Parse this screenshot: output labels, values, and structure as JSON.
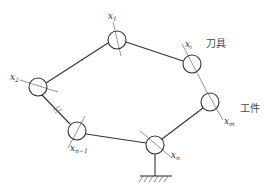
{
  "diagram": {
    "type": "closed-loop kinematic chain",
    "joints": [
      {
        "id": "x1",
        "label": "x",
        "sub": "1",
        "cx": 117,
        "cy": 40
      },
      {
        "id": "xi",
        "label": "x",
        "sub": "i",
        "cx": 192,
        "cy": 64
      },
      {
        "id": "xm",
        "label": "x",
        "sub": "m",
        "cx": 210,
        "cy": 102
      },
      {
        "id": "xn",
        "label": "x",
        "sub": "n",
        "cx": 155,
        "cy": 145
      },
      {
        "id": "xn-1",
        "label": "x",
        "sub": "n−1",
        "cx": 77,
        "cy": 131
      },
      {
        "id": "x2",
        "label": "x",
        "sub": "2",
        "cx": 38,
        "cy": 87
      }
    ],
    "annotations": {
      "tool": "刀具",
      "workpiece": "工件"
    },
    "stroke_color": "#333333"
  }
}
